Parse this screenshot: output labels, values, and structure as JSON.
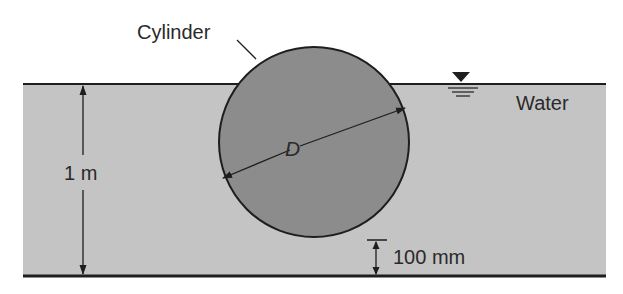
{
  "labels": {
    "cylinder": "Cylinder",
    "water": "Water",
    "diameter": "D",
    "depth": "1 m",
    "clearance": "100 mm"
  },
  "icons": {
    "free_surface": "free-surface-triangle-icon"
  },
  "colors": {
    "water": "#c4c4c4",
    "cylinder": "#8c8c8c",
    "line": "#1e1e1e",
    "background": "#ffffff"
  },
  "geometry": {
    "water_depth": "1 m",
    "cylinder_bottom_clearance": "100 mm",
    "cylinder_diameter_symbol": "D"
  }
}
